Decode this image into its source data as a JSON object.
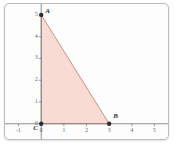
{
  "figure": {
    "kind": "coordinate-plane-triangle",
    "background_color": "#fdfdfd",
    "border_color": "#b9bcbe"
  },
  "chart_data": {
    "type": "scatter",
    "title": "",
    "xlabel": "",
    "ylabel": "",
    "xlim": [
      -1.6,
      5.6
    ],
    "ylim": [
      -0.7,
      5.5
    ],
    "grid": false,
    "axis_color": "#6f767c",
    "xticks": [
      -1,
      0,
      1,
      2,
      3,
      4,
      5
    ],
    "xticklabels": [
      "-1",
      "0",
      "1",
      "2",
      "3",
      "4",
      "5"
    ],
    "yticks": [
      0,
      1,
      2,
      3,
      4,
      5
    ],
    "yticklabels": [
      "0",
      "1",
      "2",
      "3",
      "4",
      "5"
    ],
    "points": [
      {
        "name": "A",
        "label": "A",
        "x": 0,
        "y": 5,
        "label_dx": 4,
        "label_dy": -7
      },
      {
        "name": "B",
        "label": "B",
        "x": 3,
        "y": 0,
        "label_dx": 4,
        "label_dy": -11
      },
      {
        "name": "C",
        "label": "C",
        "x": 0,
        "y": 0,
        "label_dx": -8,
        "label_dy": 1
      }
    ],
    "shapes": [
      {
        "name": "triangle-abc",
        "type": "polygon",
        "vertices": [
          [
            0,
            5
          ],
          [
            3,
            0
          ],
          [
            0,
            0
          ]
        ],
        "fill": "#f7d6cd",
        "fill_opacity": 0.85,
        "edge_color": "#c4776a",
        "edge_width": 0.8
      }
    ],
    "marker_color": "#2b2f33",
    "marker_size": 2.2
  }
}
